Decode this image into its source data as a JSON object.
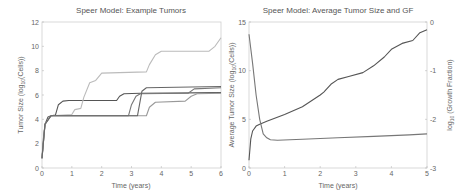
{
  "chart_data": [
    {
      "type": "line",
      "title": "Speer Model: Example Tumors",
      "xlabel": "Time (years)",
      "ylabel": "Tumor Size (log10(Cells))",
      "xlim": [
        0,
        6
      ],
      "ylim": [
        0,
        12
      ],
      "xticks": [
        "0",
        "1",
        "2",
        "3",
        "4",
        "5",
        "6"
      ],
      "yticks": [
        "0",
        "2",
        "4",
        "6",
        "8",
        "10",
        "12"
      ],
      "grid": false,
      "series": [
        {
          "name": "Tumor A",
          "color": "#555555",
          "x": [
            0,
            0.05,
            0.1,
            0.2,
            0.3,
            0.45,
            0.55,
            0.7,
            0.9,
            2.5,
            2.6,
            2.75,
            3.3,
            6.0
          ],
          "y": [
            0.8,
            2.5,
            3.6,
            4.2,
            4.3,
            4.35,
            5.2,
            5.5,
            5.55,
            5.55,
            5.9,
            6.1,
            6.15,
            6.2
          ]
        },
        {
          "name": "Tumor B",
          "color": "#bbbbbb",
          "x": [
            0,
            0.1,
            0.3,
            1.0,
            1.1,
            1.3,
            1.4,
            1.6,
            1.8,
            2.0,
            3.5,
            3.6,
            3.8,
            4.0,
            5.6,
            5.8,
            6.0
          ],
          "y": [
            0.8,
            3.6,
            4.3,
            4.4,
            4.8,
            4.9,
            5.8,
            7.0,
            7.2,
            7.8,
            7.9,
            8.5,
            9.3,
            9.6,
            9.6,
            10.0,
            10.7
          ]
        },
        {
          "name": "Tumor C",
          "color": "#777777",
          "x": [
            0,
            0.1,
            0.3,
            2.9,
            3.0,
            3.15,
            3.3,
            4.9,
            5.1,
            6.0
          ],
          "y": [
            0.8,
            3.6,
            4.3,
            4.3,
            5.2,
            5.9,
            6.1,
            6.15,
            6.5,
            6.6
          ]
        },
        {
          "name": "Tumor D",
          "color": "#999999",
          "x": [
            0,
            0.1,
            0.3,
            3.5,
            3.6,
            3.8,
            4.8,
            5.0,
            5.2,
            6.0
          ],
          "y": [
            0.8,
            3.6,
            4.3,
            4.3,
            5.0,
            5.4,
            5.5,
            5.9,
            6.1,
            6.15
          ]
        },
        {
          "name": "Tumor E",
          "color": "#666666",
          "x": [
            0,
            0.1,
            0.3,
            3.2,
            3.35,
            3.5,
            6.0
          ],
          "y": [
            0.8,
            3.6,
            4.3,
            4.3,
            6.3,
            6.6,
            6.7
          ]
        }
      ]
    },
    {
      "type": "line",
      "title": "Speer Model: Average Tumor Size and GF",
      "xlabel": "Time (years)",
      "ylabel": "Average Tumor Size (log10(Cells))",
      "ylabel_right": "log10 (Growth Fraction)",
      "xlim": [
        0,
        5
      ],
      "ylim": [
        0,
        15
      ],
      "ylim_right": [
        -3,
        0
      ],
      "xticks": [
        "0",
        "1",
        "2",
        "3",
        "4",
        "5"
      ],
      "yticks": [
        "0",
        "5",
        "10",
        "15"
      ],
      "yticks_right": [
        "-3",
        "-2",
        "-1",
        "0"
      ],
      "grid": false,
      "series": [
        {
          "name": "Average Tumor Size",
          "axis": "left",
          "color": "#555555",
          "x": [
            0,
            0.05,
            0.1,
            0.2,
            0.3,
            0.5,
            1.0,
            1.5,
            2.0,
            2.1,
            2.3,
            2.5,
            2.8,
            3.2,
            3.5,
            3.8,
            4.0,
            4.3,
            4.6,
            4.8,
            5.0
          ],
          "y": [
            0.8,
            3.0,
            3.8,
            4.3,
            4.5,
            4.8,
            5.5,
            6.3,
            7.5,
            7.8,
            8.6,
            9.1,
            9.4,
            9.8,
            10.5,
            11.4,
            12.2,
            12.8,
            13.1,
            13.9,
            14.2
          ]
        },
        {
          "name": "Growth Fraction",
          "axis": "right",
          "color": "#777777",
          "x": [
            0,
            0.1,
            0.2,
            0.3,
            0.4,
            0.5,
            0.6,
            0.8,
            1.5,
            2.5,
            3.5,
            4.5,
            5.0
          ],
          "y": [
            -0.25,
            -0.85,
            -1.5,
            -2.0,
            -2.3,
            -2.38,
            -2.42,
            -2.43,
            -2.41,
            -2.38,
            -2.35,
            -2.32,
            -2.3
          ]
        }
      ]
    }
  ]
}
